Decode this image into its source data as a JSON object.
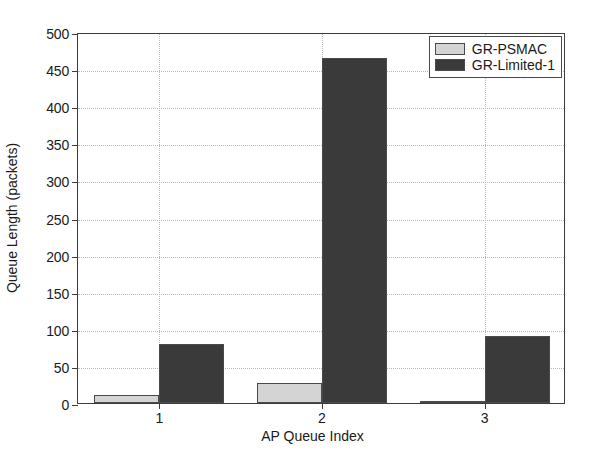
{
  "chart_data": {
    "type": "bar",
    "title": "",
    "xlabel": "AP Queue Index",
    "ylabel": "Queue Length (packets)",
    "categories": [
      "1",
      "2",
      "3"
    ],
    "series": [
      {
        "name": "GR-PSMAC",
        "color": "#d4d4d4",
        "values": [
          11,
          27,
          3
        ]
      },
      {
        "name": "GR-Limited-1",
        "color": "#3a3a3a",
        "values": [
          79,
          465,
          90
        ]
      }
    ],
    "ylim": [
      0,
      500
    ],
    "yticks": [
      0,
      50,
      100,
      150,
      200,
      250,
      300,
      350,
      400,
      450,
      500
    ],
    "ytick_labels": [
      "0",
      "50",
      "100",
      "150",
      "200",
      "250",
      "300",
      "350",
      "400",
      "450",
      "500"
    ],
    "xticks": [
      1,
      2,
      3
    ],
    "xtick_labels": [
      "1",
      "2",
      "3"
    ],
    "xlim": [
      0.5,
      3.5
    ],
    "grid": true,
    "grid_style": "dotted",
    "legend_position": "top-right",
    "legend_entries": [
      "GR-PSMAC",
      "GR-Limited-1"
    ],
    "bar_edge_color": "#4a4a4a",
    "axis_color": "#3c3c3c",
    "background": "#ffffff"
  }
}
